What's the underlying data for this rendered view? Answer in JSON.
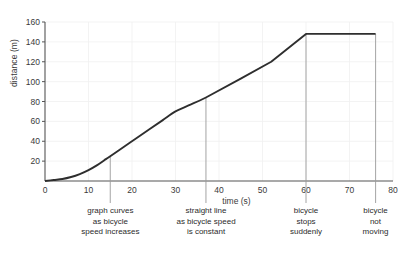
{
  "chart_data": {
    "type": "line",
    "title": "",
    "xlabel": "time (s)",
    "ylabel": "distance (m)",
    "xlim": [
      0,
      80
    ],
    "ylim": [
      0,
      160
    ],
    "xticks": [
      0,
      10,
      20,
      30,
      40,
      50,
      60,
      70,
      80
    ],
    "yticks": [
      20,
      40,
      60,
      80,
      100,
      120,
      140,
      160
    ],
    "grid": true,
    "legend": "none",
    "series": [
      {
        "name": "distance travelled",
        "color": "#2e2e2e",
        "x": [
          0,
          2,
          4,
          6,
          8,
          10,
          12,
          14,
          15,
          18,
          21,
          24,
          27,
          30,
          33,
          37,
          45,
          52,
          60,
          68,
          76
        ],
        "y": [
          0,
          1,
          2,
          4,
          7,
          11,
          16,
          22,
          25,
          34,
          43,
          52,
          61,
          70,
          76,
          84,
          103,
          120,
          148,
          148,
          148
        ]
      }
    ],
    "annotations": [
      {
        "x": 15,
        "lines": [
          "graph curves",
          "as bicycle",
          "speed increases"
        ]
      },
      {
        "x": 37,
        "lines": [
          "straight line",
          "as bicycle speed",
          "is constant"
        ]
      },
      {
        "x": 60,
        "lines": [
          "bicycle",
          "stops",
          "suddenly"
        ]
      },
      {
        "x": 76,
        "lines": [
          "bicycle",
          "not",
          "moving"
        ]
      }
    ],
    "axis_color": "#555555",
    "grid_color": "#f0f0f0",
    "annotation_line_color": "#9a9a9a",
    "background": "#ffffff"
  }
}
